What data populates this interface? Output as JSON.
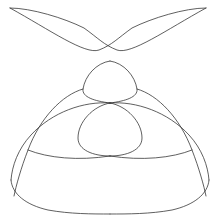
{
  "figure": {
    "background_color": "#ffffff",
    "stroke_color": "#2b2b2b",
    "stroke_width": 0.75,
    "width": 215,
    "height": 222,
    "symmetry_axis_x": 108
  },
  "chart_data": {
    "type": "line",
    "title": "",
    "subtitle": "",
    "xlabel": "",
    "ylabel": "",
    "grid": false,
    "legend": false,
    "axes_visible": false,
    "tick_labels_x": [],
    "tick_labels_y": [],
    "xlim": [
      0,
      215
    ],
    "ylim": [
      222,
      0
    ],
    "annotations": [],
    "features": {
      "cusp_left": [
        10,
        8
      ],
      "cusp_right": [
        206,
        8
      ],
      "central_node": [
        110,
        103
      ],
      "upper_teardrop_apex": [
        110,
        61
      ],
      "upper_teardrop_bottom": [
        110,
        103
      ],
      "upper_teardrop_half_width": 28,
      "lower_teardrop_top": [
        110,
        103
      ],
      "lower_teardrop_bottom": [
        110,
        156
      ],
      "lower_teardrop_half_width": 34,
      "upper_x_crossing_left": [
        99,
        50
      ],
      "upper_x_crossing_right": [
        120,
        50
      ],
      "outer_lobe_left_cross": [
        28,
        150
      ],
      "outer_lobe_right_cross": [
        187,
        150
      ],
      "outer_lobe_bottom": [
        110,
        213
      ],
      "leftmost_x": 10,
      "rightmost_x": 206,
      "topmost_y": 7,
      "bottommost_y": 214
    },
    "series": [
      {
        "name": "branch-upper-left-cusp",
        "path": "M 10 8 C 50 30, 85 55, 99 50 C 112 45, 118 38, 132 28 C 152 18, 185 8, 206 8"
      },
      {
        "name": "branch-upper-right-cusp",
        "path": "M 206 8 C 166 30, 131 55, 117 50 C 104 45, 98 38, 84 28 C 64 18, 31 8, 10 8"
      },
      {
        "name": "upper-teardrop-left",
        "path": "M 110 61 C 96 63, 85 76, 83 89 C 82 97, 94 101, 110 103"
      },
      {
        "name": "upper-teardrop-right",
        "path": "M 110 61 C 124 63, 135 76, 137 89 C 138 97, 126 101, 110 103"
      },
      {
        "name": "lower-teardrop-left",
        "path": "M 110 103 C 93 106, 78 122, 78 138 C 78 150, 93 156, 110 156"
      },
      {
        "name": "lower-teardrop-right",
        "path": "M 110 103 C 127 106, 142 122, 142 138 C 142 150, 127 156, 110 156"
      },
      {
        "name": "outer-lobe-left-inner",
        "path": "M 110 103 C 84 101, 52 112, 31 135 C 18 149, 12 166, 11 180"
      },
      {
        "name": "outer-lobe-right-inner",
        "path": "M 110 103 C 136 101, 168 112, 189 135 C 202 149, 208 166, 209 180"
      },
      {
        "name": "outer-lobe-bottom-left",
        "path": "M 11 180 C 12 194, 26 205, 48 210 C 70 214, 92 214, 110 214"
      },
      {
        "name": "outer-lobe-bottom-right",
        "path": "M 209 180 C 208 194, 194 205, 172 210 C 150 214, 128 214, 110 214"
      },
      {
        "name": "mid-arc-left",
        "path": "M 83 89 C 62 95, 40 118, 28 150 C 21 168, 16 186, 14 196"
      },
      {
        "name": "mid-arc-right",
        "path": "M 137 89 C 158 95, 180 118, 192 150 C 199 168, 204 186, 206 196"
      },
      {
        "name": "cross-arc-left",
        "path": "M 28 150 C 48 158, 78 161, 110 156"
      },
      {
        "name": "cross-arc-right",
        "path": "M 192 150 C 172 158, 142 161, 110 156"
      }
    ]
  }
}
